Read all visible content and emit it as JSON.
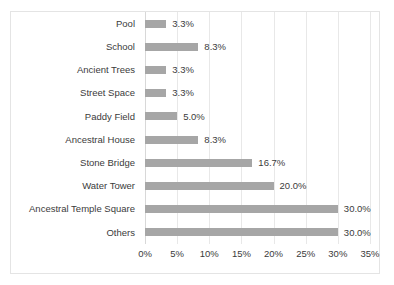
{
  "chart_data": {
    "type": "bar",
    "orientation": "horizontal",
    "title": "",
    "xlabel": "",
    "ylabel": "",
    "xlim": [
      0,
      35
    ],
    "grid": true,
    "legend": false,
    "bar_color": "#a6a6a6",
    "categories": [
      "Pool",
      "School",
      "Ancient Trees",
      "Street Space",
      "Paddy Field",
      "Ancestral House",
      "Stone Bridge",
      "Water Tower",
      "Ancestral Temple Square",
      "Others"
    ],
    "values": [
      3.3,
      8.3,
      3.3,
      3.3,
      5.0,
      8.3,
      16.7,
      20.0,
      30.0,
      30.0
    ],
    "value_labels": [
      "3.3%",
      "8.3%",
      "3.3%",
      "3.3%",
      "5.0%",
      "8.3%",
      "16.7%",
      "20.0%",
      "30.0%",
      "30.0%"
    ],
    "xticks": [
      0,
      5,
      10,
      15,
      20,
      25,
      30,
      35
    ],
    "xtick_labels": [
      "0%",
      "5%",
      "10%",
      "15%",
      "20%",
      "25%",
      "30%",
      "35%"
    ]
  }
}
